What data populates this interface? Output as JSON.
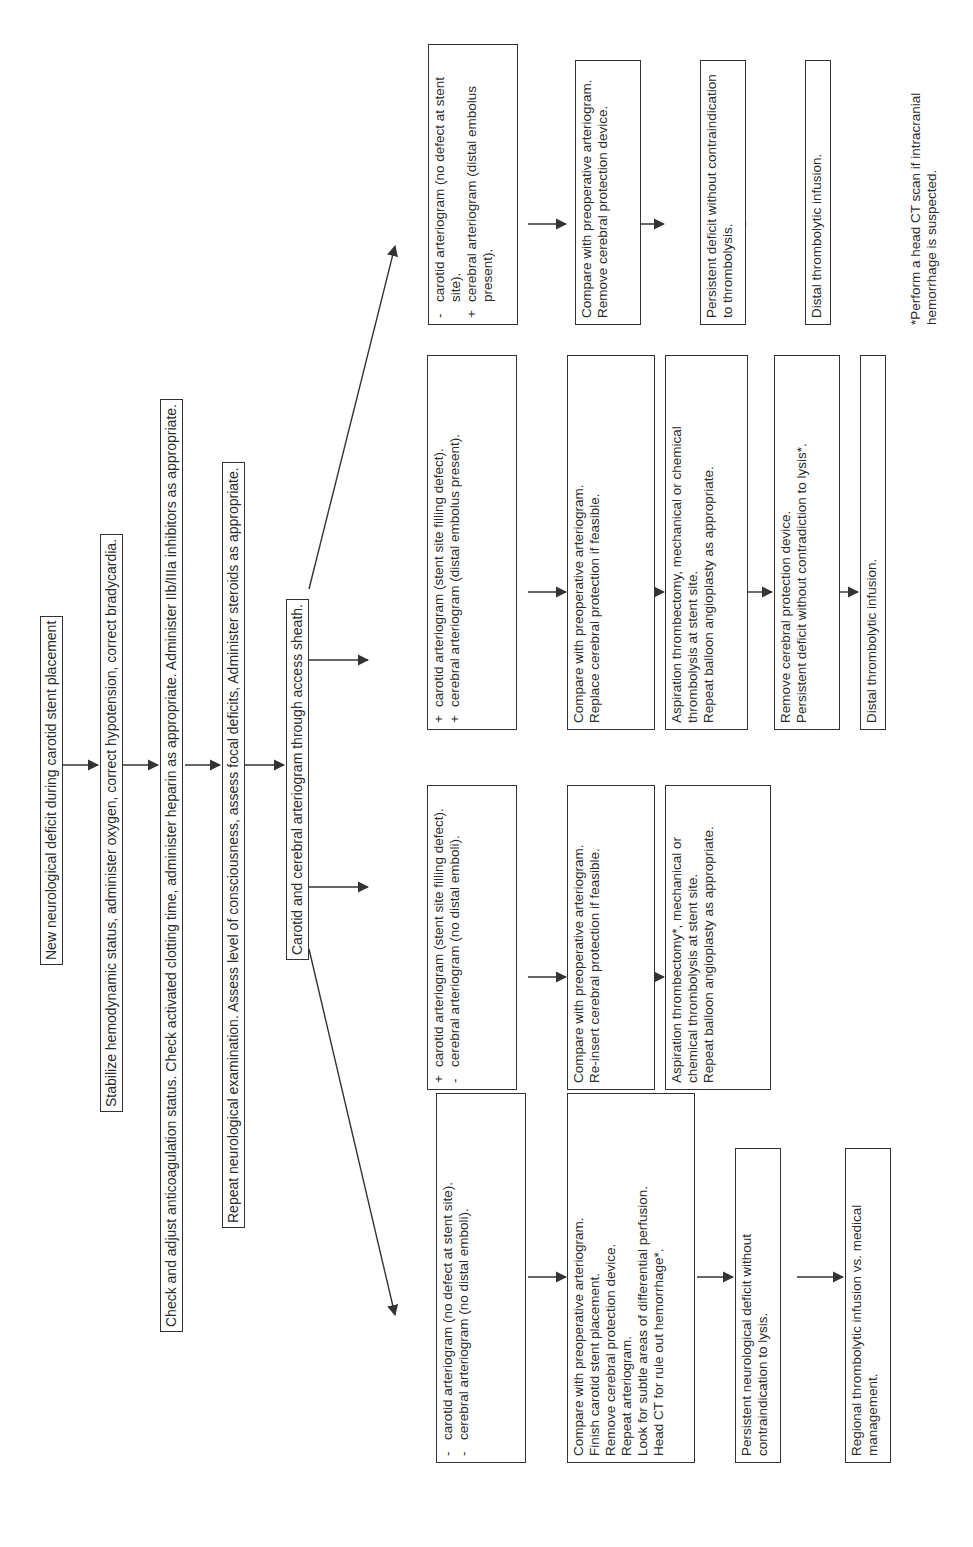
{
  "main_chain": [
    {
      "id": "new-deficit",
      "text": "New neurological deficit during carotid stent placement"
    },
    {
      "id": "stabilize",
      "text": "Stabilize hemodynamic status, administer oxygen, correct hypotension, correct bradycardia."
    },
    {
      "id": "anticoagulation",
      "text": "Check and adjust anticoagulation status. Check activated clotting time, administer heparin as appropriate. Administer IIb/IIIa inhibitors as appropriate."
    },
    {
      "id": "repeat-exam",
      "text": "Repeat neurological examination. Assess level of consciousness, assess focal deficits, Administer steroids as appropriate."
    },
    {
      "id": "arteriogram",
      "text": "Carotid and cerebral arteriogram through access sheath."
    }
  ],
  "branches": [
    {
      "findings": [
        {
          "sign": "-",
          "text": "carotid arteriogram (no defect at stent site)."
        },
        {
          "sign": "-",
          "text": "cerebral arteriogram (no distal emboli)."
        }
      ],
      "steps": [
        [
          "Compare with preoperative arteriogram.",
          "Finish carotid stent placement.",
          "Remove cerebral protection device.",
          "Repeat arteriogram.",
          "Look for subtle areas of differential perfusion.",
          "Head CT for rule out hemorrhage*."
        ],
        [
          "Persistent neurological deficit without contraindication to lysis."
        ],
        [
          "Regional thrombolytic infusion vs. medical management."
        ]
      ]
    },
    {
      "findings": [
        {
          "sign": "+",
          "text": "carotid arteriogram (stent site filling defect)."
        },
        {
          "sign": "-",
          "text": "cerebral arteriogram (no distal emboli)."
        }
      ],
      "steps": [
        [
          "Compare with preoperative arteriogram.",
          "Re-insert cerebral protection if feasible."
        ],
        [
          "Aspiration thrombectomy*, mechanical or chemical thrombolysis at stent site.",
          "Repeat balloon angioplasty as appropriate."
        ]
      ]
    },
    {
      "findings": [
        {
          "sign": "+",
          "text": "carotid arteriogram (stent site filling defect)."
        },
        {
          "sign": "+",
          "text": "cerebral arteriogram (distal embolus present)."
        }
      ],
      "steps": [
        [
          "Compare with preoperative arteriogram.",
          "Replace cerebral protection if feasible."
        ],
        [
          "Aspiration thrombectomy, mechanical or chemical thrombolysis at stent site.",
          "Repeat balloon angioplasty as appropriate."
        ],
        [
          "Remove cerebral protection device.",
          "Persistent deficit without contradiction to lysis*."
        ],
        [
          "Distal thrombolytic infusion."
        ]
      ]
    },
    {
      "findings": [
        {
          "sign": "-",
          "text": "carotid arteriogram (no defect at stent site)."
        },
        {
          "sign": "+",
          "text": "cerebral arteriogram (distal embolus present)."
        }
      ],
      "steps": [
        [
          "Compare with preoperative arteriogram.",
          "Remove cerebral protection device."
        ],
        [
          "Persistent deficit without contraindication to thrombolysis."
        ],
        [
          "Distal thrombolytic infusion."
        ]
      ]
    }
  ],
  "footnote": "*Perform a head CT scan if intracranial hemorrhage is suspected.",
  "colors": {
    "line": "#333333",
    "text": "#2a2a2a",
    "background": "#ffffff"
  }
}
